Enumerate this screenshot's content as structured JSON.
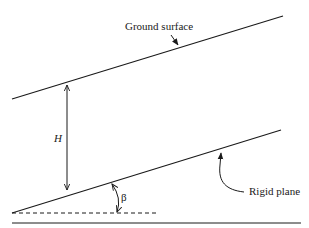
{
  "diagram": {
    "labels": {
      "ground_surface": "Ground surface",
      "rigid_plane": "Rigid plane",
      "height": "H",
      "angle": "β"
    },
    "elements": {
      "ground_surface_line": {
        "x1": 12,
        "y1": 99,
        "x2": 283,
        "y2": 16
      },
      "rigid_plane_line": {
        "x1": 12,
        "y1": 213,
        "x2": 281,
        "y2": 130
      },
      "horizontal_reference_dashed": {
        "x1": 12,
        "y1": 213,
        "x2": 156,
        "y2": 213
      },
      "base_line": {
        "x1": 12,
        "y1": 223,
        "x2": 301,
        "y2": 223
      },
      "height_dimension_arrow": {
        "x": 67,
        "y1": 84,
        "y2": 191
      }
    },
    "colors": {
      "stroke": "#1a1a1a",
      "background": "#ffffff"
    }
  }
}
